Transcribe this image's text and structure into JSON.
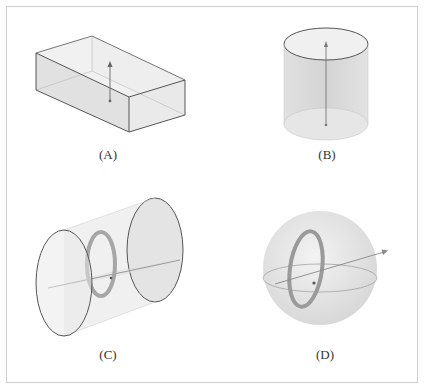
{
  "figure": {
    "panels": [
      {
        "id": "A",
        "label": "(A)",
        "shape": "rectangular-box",
        "description": "Rectangular box with vertical arrow inside"
      },
      {
        "id": "B",
        "label": "(B)",
        "shape": "vertical-cylinder",
        "description": "Upright cylinder with vertical axis arrow"
      },
      {
        "id": "C",
        "label": "(C)",
        "shape": "horizontal-cylinder",
        "description": "Horizontal cylinder with ring and horizontal axis"
      },
      {
        "id": "D",
        "label": "(D)",
        "shape": "sphere",
        "description": "Sphere with ring and tilted axis arrow"
      }
    ]
  },
  "colors": {
    "stroke": "#555555",
    "fill_light": "#ebebeb",
    "fill_mid": "#dcdcdc",
    "ring": "#9a9a9a",
    "frame": "#cfcfcf"
  }
}
